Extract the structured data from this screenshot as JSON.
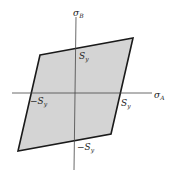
{
  "diagram": {
    "axes": {
      "horizontal": {
        "label": "σ",
        "subscript": "A"
      },
      "vertical": {
        "label": "σ",
        "subscript": "B"
      }
    },
    "intercepts": {
      "top": {
        "label": "S",
        "subscript": "y"
      },
      "right": {
        "label": "S",
        "subscript": "y"
      },
      "left": {
        "label": "−S",
        "subscript": "y"
      },
      "bottom": {
        "label": "−S",
        "subscript": "y"
      }
    },
    "region": {
      "shape": "parallelogram",
      "fill": "#d4d4d4",
      "stroke": "#1a1a1a"
    }
  }
}
